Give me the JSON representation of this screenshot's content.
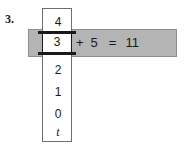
{
  "problem": {
    "number_label": "3.",
    "equation": {
      "selected_value": "3",
      "operator": "+",
      "addend": "5",
      "equals": "=",
      "result": "11"
    },
    "column": {
      "values": [
        "4",
        "3",
        "2",
        "1",
        "0",
        "t"
      ],
      "highlighted_index": 1
    },
    "colors": {
      "highlight_bar": "#b4b4b4",
      "rule": "#1a1a1a",
      "column_border": "#6e6e6e",
      "background": "#ffffff"
    }
  }
}
